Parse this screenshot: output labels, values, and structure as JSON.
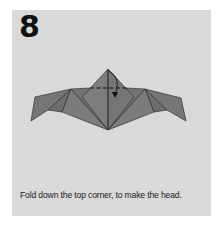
{
  "step": {
    "number": "8",
    "caption": "Fold down the top corner, to make the head."
  },
  "diagram": {
    "icons": [
      "dashed-fold-line",
      "curved-fold-arrow"
    ],
    "colors": {
      "background": "#d9d9d9",
      "paper": "#7a7a7a",
      "paper_dark": "#6a6a6a",
      "line": "#333333"
    }
  }
}
